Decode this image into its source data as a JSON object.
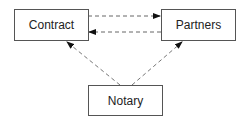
{
  "diagram": {
    "nodes": [
      {
        "id": "contract",
        "label": "Contract"
      },
      {
        "id": "partners",
        "label": "Partners"
      },
      {
        "id": "notary",
        "label": "Notary"
      }
    ],
    "edges": [
      {
        "from": "contract",
        "to": "partners",
        "style": "dashed"
      },
      {
        "from": "partners",
        "to": "contract",
        "style": "dashed"
      },
      {
        "from": "notary",
        "to": "contract",
        "style": "dashed"
      },
      {
        "from": "notary",
        "to": "partners",
        "style": "dashed"
      }
    ],
    "colors": {
      "stroke": "#555555",
      "text": "#222222",
      "background": "#ffffff"
    }
  }
}
